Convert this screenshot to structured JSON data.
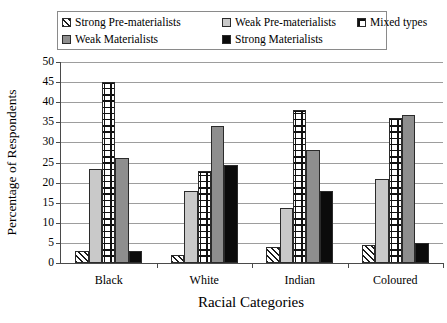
{
  "chart_data": {
    "type": "bar",
    "title": "",
    "xlabel": "Racial Categories",
    "ylabel": "Percentage of Respondents",
    "ylim": [
      0,
      50
    ],
    "ytick_step": 5,
    "yticks": [
      0,
      5,
      10,
      15,
      20,
      25,
      30,
      35,
      40,
      45,
      50
    ],
    "grid": true,
    "legend_position": "top",
    "categories": [
      "Black",
      "White",
      "Indian",
      "Coloured"
    ],
    "series": [
      {
        "name": "Strong Pre-materialists",
        "pattern": "diagonal-hatch",
        "color": "#ffffff",
        "values": [
          3.0,
          2.0,
          4.0,
          4.5
        ]
      },
      {
        "name": "Weak Pre-materialists",
        "pattern": "light-gray-solid",
        "color": "#c9c9c9",
        "values": [
          23.3,
          17.8,
          13.8,
          21.0
        ]
      },
      {
        "name": "Mixed types",
        "pattern": "cross-checker",
        "color": "#ffffff",
        "values": [
          45.0,
          23.0,
          38.0,
          36.0
        ]
      },
      {
        "name": "Weak Materialists",
        "pattern": "mid-gray-solid",
        "color": "#8e8e8e",
        "values": [
          26.0,
          34.0,
          28.0,
          36.8
        ]
      },
      {
        "name": "Strong Materialists",
        "pattern": "black-solid",
        "color": "#0b0b0b",
        "values": [
          3.0,
          24.5,
          18.0,
          5.0
        ]
      }
    ]
  },
  "legend": {
    "items": [
      {
        "label": "Strong Pre-materialists",
        "swatch": "diagonal-hatch-swatch"
      },
      {
        "label": "Weak Pre-materialists",
        "swatch": "light-gray-swatch"
      },
      {
        "label": "Mixed types",
        "swatch": "cross-checker-swatch"
      },
      {
        "label": "Weak Materialists",
        "swatch": "mid-gray-swatch"
      },
      {
        "label": "Strong Materialists",
        "swatch": "black-swatch"
      }
    ]
  }
}
